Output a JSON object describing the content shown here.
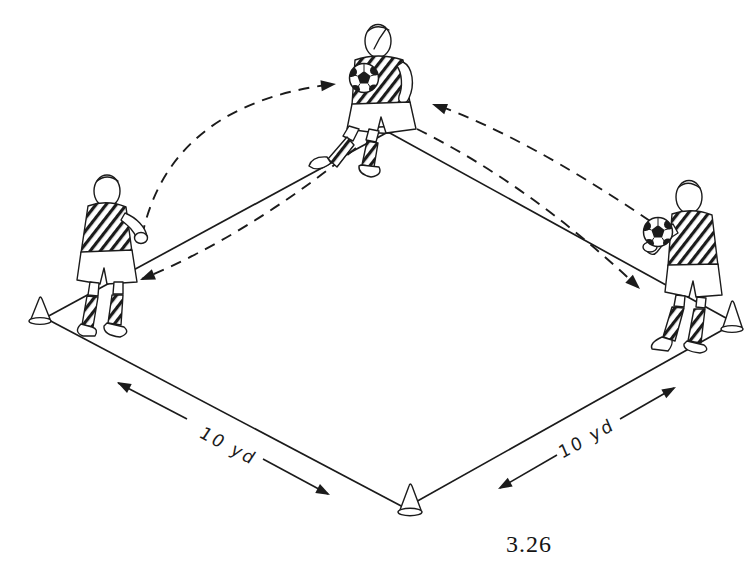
{
  "figure": {
    "caption": "3.26",
    "colors": {
      "ink": "#1b1b1b",
      "paper": "#ffffff"
    }
  },
  "dimensions": {
    "left": {
      "label": "10 yd"
    },
    "right": {
      "label": "10 yd"
    }
  }
}
